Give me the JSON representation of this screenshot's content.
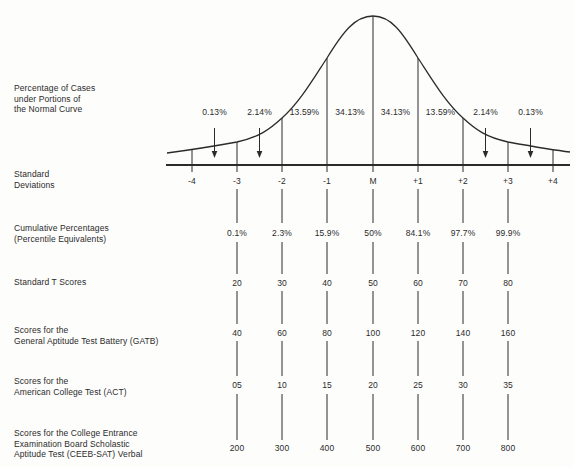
{
  "colors": {
    "ink": "#2b2b2b",
    "background": "#fdfdfc"
  },
  "figure": {
    "left_labels": {
      "percentage_cases": "Percentage of Cases\nunder Portions of\nthe Normal Curve",
      "standard_deviations": "Standard\nDeviations",
      "cumulative_percentages": "Cumulative Percentages\n(Percentile Equivalents)",
      "t_scores": "Standard T Scores",
      "gatb": "Scores for the\nGeneral Aptitude Test Battery (GATB)",
      "act": "Scores for the\nAmerican College Test (ACT)",
      "ceeb": "Scores for the College Entrance\nExamination Board Scholastic\nAptitude Test (CEEB-SAT) Verbal"
    },
    "curve_segment_percentages": [
      "0.13%",
      "2.14%",
      "13.59%",
      "34.13%",
      "34.13%",
      "13.59%",
      "2.14%",
      "0.13%"
    ],
    "rows": [
      {
        "id": "sd",
        "values": [
          "-4",
          "-3",
          "-2",
          "-1",
          "M",
          "+1",
          "+2",
          "+3",
          "+4"
        ]
      },
      {
        "id": "cumulative",
        "values": [
          "0.1%",
          "2.3%",
          "15.9%",
          "50%",
          "84.1%",
          "97.7%",
          "99.9%"
        ]
      },
      {
        "id": "tscores",
        "values": [
          "20",
          "30",
          "40",
          "50",
          "60",
          "70",
          "80"
        ]
      },
      {
        "id": "gatb",
        "values": [
          "40",
          "60",
          "80",
          "100",
          "120",
          "140",
          "160"
        ]
      },
      {
        "id": "act",
        "values": [
          "05",
          "10",
          "15",
          "20",
          "25",
          "30",
          "35"
        ]
      },
      {
        "id": "ceeb",
        "values": [
          "200",
          "300",
          "400",
          "500",
          "600",
          "700",
          "800"
        ]
      }
    ]
  }
}
